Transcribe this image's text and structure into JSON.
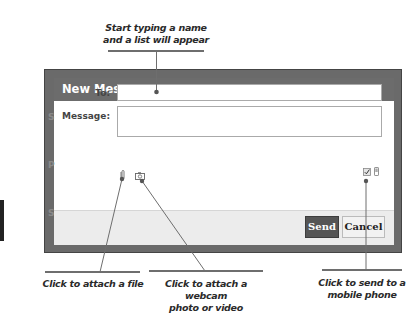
{
  "callouts": {
    "top": {
      "line1": "Start typing a name",
      "line2": "and a list will appear"
    },
    "attach_file": "Click to attach a file",
    "webcam": {
      "line1": "Click to attach a webcam",
      "line2": "photo or video"
    },
    "mobile": {
      "line1": "Click to send to a",
      "line2": "mobile phone"
    }
  },
  "dialog": {
    "title": "New Message",
    "fields": {
      "to": {
        "label": "To:",
        "value": ""
      },
      "message": {
        "label": "Message:",
        "value": ""
      }
    },
    "icons": {
      "attach_file": "paperclip-icon",
      "webcam": "camera-icon",
      "send_to_mobile_checkbox": "checkbox-checked-icon",
      "mobile": "mobile-phone-icon"
    },
    "buttons": {
      "send": "Send",
      "cancel": "Cancel"
    }
  },
  "background": {
    "letters": [
      "S",
      "P",
      "S"
    ]
  },
  "colors": {
    "frame": "#6a6a6a",
    "titlebar": "#6c6c6c",
    "send_button": "#555555",
    "footer": "#ececec",
    "callout_line": "#6e6e6e"
  }
}
